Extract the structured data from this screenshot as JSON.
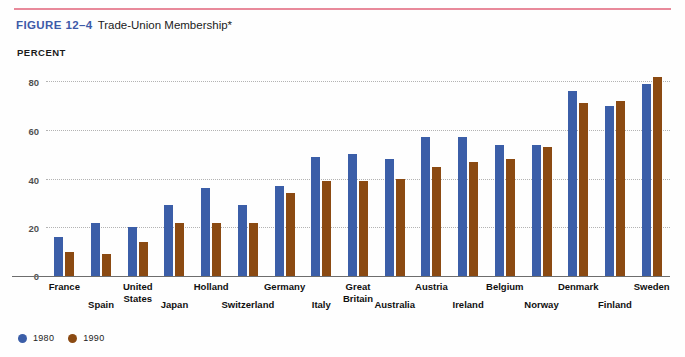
{
  "figure": {
    "number_label": "FIGURE 12–4",
    "title": "Trade-Union Membership*",
    "rule_color": "#e8899a",
    "number_color": "#3d5aa8"
  },
  "legend": {
    "position": "bottom-left",
    "items": [
      {
        "label": "1980",
        "color": "#3b5ea8",
        "icon": "circle-swatch-icon"
      },
      {
        "label": "1990",
        "color": "#8b4a12",
        "icon": "circle-swatch-icon"
      }
    ]
  },
  "chart_data": {
    "type": "bar",
    "title": "Trade-Union Membership*",
    "xlabel": "",
    "ylabel": "PERCENT",
    "ylim": [
      0,
      88
    ],
    "yticks": [
      0,
      20,
      40,
      60,
      80
    ],
    "ytick_labels": [
      "0",
      "20",
      "40",
      "60",
      "80"
    ],
    "grid": true,
    "grid_style": "dotted-horizontal",
    "legend_position": "bottom-left",
    "categories": [
      "France",
      "Spain",
      "United States",
      "Japan",
      "Holland",
      "Switzerland",
      "Germany",
      "Italy",
      "Great Britain",
      "Australia",
      "Austria",
      "Ireland",
      "Belgium",
      "Norway",
      "Denmark",
      "Finland",
      "Sweden"
    ],
    "category_labels": [
      [
        "France"
      ],
      [
        "Spain"
      ],
      [
        "United",
        "States"
      ],
      [
        "Japan"
      ],
      [
        "Holland"
      ],
      [
        "Switzerland"
      ],
      [
        "Germany"
      ],
      [
        "Italy"
      ],
      [
        "Great",
        "Britain"
      ],
      [
        "Australia"
      ],
      [
        "Austria"
      ],
      [
        "Ireland"
      ],
      [
        "Belgium"
      ],
      [
        "Norway"
      ],
      [
        "Denmark"
      ],
      [
        "Finland"
      ],
      [
        "Sweden"
      ]
    ],
    "series": [
      {
        "name": "1980",
        "color": "#3b5ea8",
        "values": [
          16,
          22,
          20,
          29,
          36,
          29,
          37,
          49,
          50,
          48,
          57,
          57,
          54,
          54,
          76,
          70,
          79
        ]
      },
      {
        "name": "1990",
        "color": "#8b4a12",
        "values": [
          10,
          9,
          14,
          22,
          22,
          22,
          34,
          39,
          39,
          40,
          45,
          47,
          48,
          53,
          71,
          72,
          82
        ]
      }
    ]
  }
}
